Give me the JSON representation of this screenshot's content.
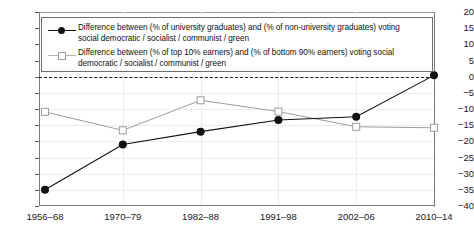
{
  "chart_data": {
    "type": "line",
    "title": "",
    "subtitle": "",
    "xlabel": "",
    "ylabel": "",
    "categories": [
      "1956–68",
      "1970–79",
      "1982–88",
      "1991–98",
      "2002–06",
      "2010–14"
    ],
    "ylim": [
      -40,
      20
    ],
    "ytick_step": 5,
    "yticks": [
      "20",
      "15",
      "10",
      "5",
      "0",
      "−5",
      "−10",
      "−15",
      "−20",
      "−25",
      "−30",
      "−35",
      "−40"
    ],
    "grid": true,
    "zero_reference_line": 0,
    "legend_position": "top-inside",
    "series": [
      {
        "name": "Difference between (% of university graduates) and (% of non-university graduates) voting social democratic / socialist / communist / green",
        "marker": "filled-circle",
        "color": "#111111",
        "values": [
          -35.0,
          -21.0,
          -17.0,
          -13.4,
          -12.4,
          0.4
        ]
      },
      {
        "name": "Difference between (% of top 10% earners) and (% of bottom 90% earners) voting social democratic / socialist / communist / green",
        "marker": "hollow-square",
        "color": "#9d9d9d",
        "values": [
          -10.9,
          -16.6,
          -7.3,
          -10.8,
          -15.5,
          -15.8
        ]
      }
    ]
  },
  "legend": {
    "entries": [
      {
        "line1": "Difference between (% of university graduates) and (% of non-university graduates) voting",
        "line2": "social democratic / socialist / communist / green"
      },
      {
        "line1": "Difference between (% of top 10% earners) and (% of bottom 90% earners) voting social",
        "line2": "democratic / socialist / communist / green"
      }
    ]
  }
}
